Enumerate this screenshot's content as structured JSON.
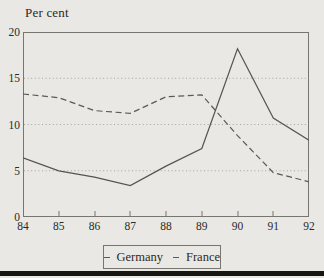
{
  "figure": {
    "background_color": "#e9e8e4",
    "bottom_rule_color": "#161614"
  },
  "chart_data": {
    "type": "line",
    "title": "",
    "ylabel": "Per cent",
    "xlabel": "",
    "xlim": [
      84,
      92
    ],
    "ylim": [
      0,
      20
    ],
    "x": [
      84,
      85,
      86,
      87,
      88,
      89,
      90,
      91,
      92
    ],
    "x_tick_labels": [
      "84",
      "85",
      "86",
      "87",
      "88",
      "89",
      "90",
      "91",
      "92"
    ],
    "y_ticks": [
      0,
      5,
      10,
      15,
      20
    ],
    "grid_y_values": [
      5,
      10,
      15
    ],
    "grid_style": "dotted",
    "legend_position": "bottom-center",
    "series": [
      {
        "name": "Germany",
        "style": "solid",
        "color": "#55544f",
        "values": [
          6.4,
          5.0,
          4.3,
          3.4,
          5.5,
          7.4,
          18.2,
          10.7,
          8.3
        ]
      },
      {
        "name": "France",
        "style": "dashed",
        "color": "#5b5a55",
        "values": [
          13.3,
          12.9,
          11.5,
          11.2,
          13.0,
          13.2,
          8.8,
          4.8,
          3.8
        ]
      }
    ]
  }
}
